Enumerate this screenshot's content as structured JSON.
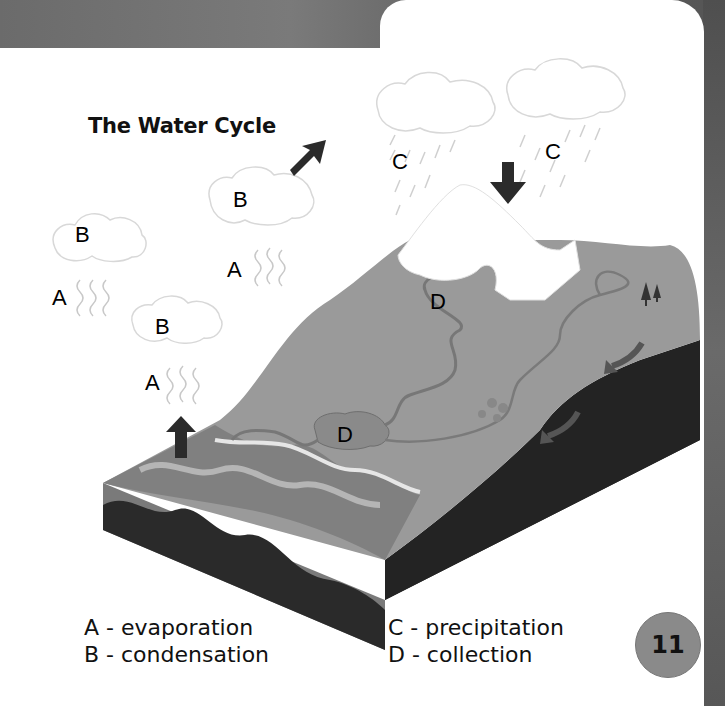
{
  "title": "The Water Cycle",
  "page_number": "11",
  "diagram_labels": [
    {
      "letter": "B",
      "x": 75,
      "y": 222
    },
    {
      "letter": "A",
      "x": 52,
      "y": 285
    },
    {
      "letter": "B",
      "x": 233,
      "y": 187
    },
    {
      "letter": "A",
      "x": 227,
      "y": 257
    },
    {
      "letter": "B",
      "x": 155,
      "y": 314
    },
    {
      "letter": "A",
      "x": 145,
      "y": 370
    },
    {
      "letter": "C",
      "x": 392,
      "y": 149
    },
    {
      "letter": "C",
      "x": 545,
      "y": 139
    },
    {
      "letter": "D",
      "x": 430,
      "y": 289
    },
    {
      "letter": "D",
      "x": 337,
      "y": 422
    }
  ],
  "legend": {
    "a": "A - evaporation",
    "b": "B - condensation",
    "c": "C - precipitation",
    "d": "D - collection"
  },
  "colors": {
    "ocean_surface": "#8c8c8c",
    "land": "#9a9a9a",
    "ground_dark": "#2a2a2a",
    "arrow": "#2b2b2b",
    "page_badge": "#8a8a8a"
  }
}
